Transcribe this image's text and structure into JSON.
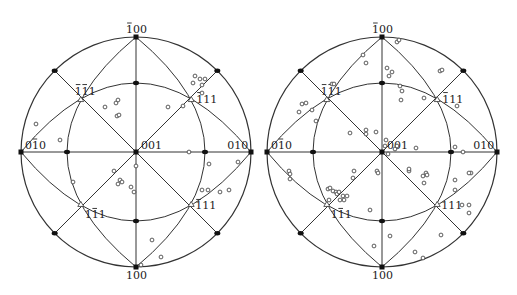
{
  "figure": {
    "type": "stereographic_projection_pair",
    "stroke_color": "#333333",
    "point_color": "#333333",
    "background": "#ffffff"
  },
  "plots": [
    {
      "id": "left",
      "cx": 136,
      "cy": 152,
      "r": 115,
      "labels": {
        "top": "100",
        "top_bar": "1",
        "bottom": "100",
        "left": "010",
        "left_bar": "1",
        "right": "010",
        "center": "001",
        "upper_left": "111",
        "upper_left_bars": [
          0,
          1
        ],
        "upper_right": "111",
        "upper_right_bars": [
          0
        ],
        "lower_left": "111",
        "lower_left_bars": [
          1
        ],
        "lower_right": "111",
        "lower_right_bars": [
          0
        ]
      },
      "points": [
        [
          195,
          76
        ],
        [
          200,
          79
        ],
        [
          205,
          79
        ],
        [
          202,
          85
        ],
        [
          202,
          93
        ],
        [
          193,
          83
        ],
        [
          183,
          106
        ],
        [
          168,
          107
        ],
        [
          105,
          107
        ],
        [
          116,
          103
        ],
        [
          118,
          100
        ],
        [
          117,
          116
        ],
        [
          119,
          115
        ],
        [
          36,
          124
        ],
        [
          60,
          140
        ],
        [
          189,
          152
        ],
        [
          136,
          166
        ],
        [
          114,
          171
        ],
        [
          120,
          180
        ],
        [
          122,
          182
        ],
        [
          118,
          184
        ],
        [
          131,
          187
        ],
        [
          134,
          192
        ],
        [
          73,
          182
        ],
        [
          209,
          164
        ],
        [
          238,
          162
        ],
        [
          202,
          190
        ],
        [
          208,
          190
        ],
        [
          220,
          192
        ],
        [
          229,
          190
        ],
        [
          152,
          240
        ],
        [
          161,
          257
        ],
        [
          141,
          265
        ]
      ]
    },
    {
      "id": "right",
      "cx": 382,
      "cy": 152,
      "r": 115,
      "labels": {
        "top": "100",
        "top_bar": "1",
        "bottom": "100",
        "left": "010",
        "left_bar": "1",
        "right": "010",
        "center": "001",
        "upper_left": "111",
        "upper_left_bars": [
          0,
          1
        ],
        "upper_right": "111",
        "upper_right_bars": [
          0
        ],
        "lower_left": "111",
        "lower_left_bars": [
          1
        ],
        "lower_right": "111",
        "lower_right_bars": []
      },
      "points": [
        [
          397,
          42
        ],
        [
          399,
          40
        ],
        [
          363,
          55
        ],
        [
          366,
          63
        ],
        [
          387,
          68
        ],
        [
          392,
          72
        ],
        [
          389,
          76
        ],
        [
          440,
          71
        ],
        [
          442,
          70
        ],
        [
          332,
          84
        ],
        [
          334,
          84
        ],
        [
          400,
          86
        ],
        [
          402,
          91
        ],
        [
          401,
          100
        ],
        [
          424,
          98
        ],
        [
          457,
          106
        ],
        [
          299,
          112
        ],
        [
          302,
          104
        ],
        [
          306,
          103
        ],
        [
          312,
          110
        ],
        [
          316,
          121
        ],
        [
          350,
          133
        ],
        [
          366,
          130
        ],
        [
          366,
          134
        ],
        [
          376,
          132
        ],
        [
          386,
          140
        ],
        [
          385,
          146
        ],
        [
          388,
          154
        ],
        [
          395,
          149
        ],
        [
          397,
          146
        ],
        [
          416,
          148
        ],
        [
          455,
          147
        ],
        [
          463,
          152
        ],
        [
          455,
          180
        ],
        [
          455,
          190
        ],
        [
          471,
          173
        ],
        [
          469,
          173
        ],
        [
          462,
          205
        ],
        [
          469,
          205
        ],
        [
          469,
          213
        ],
        [
          353,
          178
        ],
        [
          354,
          171
        ],
        [
          377,
          171
        ],
        [
          378,
          173
        ],
        [
          409,
          171
        ],
        [
          409,
          169
        ],
        [
          426,
          173
        ],
        [
          424,
          183
        ],
        [
          427,
          175
        ],
        [
          423,
          176
        ],
        [
          289,
          171
        ],
        [
          290,
          174
        ],
        [
          290,
          179
        ],
        [
          328,
          189
        ],
        [
          330,
          188
        ],
        [
          333,
          191
        ],
        [
          336,
          192
        ],
        [
          337,
          194
        ],
        [
          339,
          192
        ],
        [
          343,
          196
        ],
        [
          347,
          196
        ],
        [
          344,
          200
        ],
        [
          329,
          200
        ],
        [
          340,
          200
        ],
        [
          370,
          210
        ],
        [
          390,
          236
        ],
        [
          374,
          246
        ],
        [
          441,
          235
        ],
        [
          415,
          252
        ],
        [
          423,
          258
        ]
      ]
    }
  ]
}
